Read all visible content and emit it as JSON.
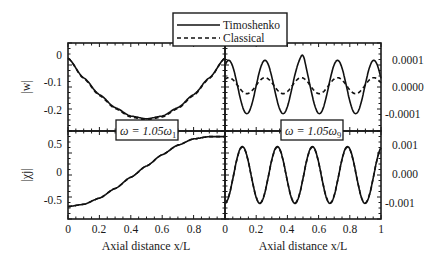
{
  "legend": {
    "entries": [
      {
        "label": "Timoshenko",
        "style": "solid"
      },
      {
        "label": "Classical",
        "style": "dashed"
      }
    ]
  },
  "labels": {
    "freq_left": "ω = 1.05ω",
    "freq_left_sub": "1",
    "freq_right": "ω = 1.05ω",
    "freq_right_sub": "9",
    "ylabel_top": "|w|",
    "ylabel_bottom": "|χj|",
    "xlabel_left": "Axial distance x/L",
    "xlabel_right": "Axial distance x/L"
  },
  "colors": {
    "line": "#111111",
    "background": "#ffffff"
  },
  "chart_data": [
    {
      "type": "line",
      "panel": "top-left",
      "title": "ω = 1.05ω1",
      "xlabel": "",
      "ylabel": "|w|",
      "xlim": [
        0,
        1
      ],
      "ylim": [
        -0.245,
        0.045
      ],
      "yticks": [
        "0",
        "-0.1",
        "-0.2"
      ],
      "x": [
        0,
        0.1,
        0.2,
        0.3,
        0.4,
        0.5,
        0.6,
        0.7,
        0.8,
        0.9,
        1.0
      ],
      "series": [
        {
          "name": "Timoshenko",
          "values": [
            -0.005,
            -0.07,
            -0.125,
            -0.168,
            -0.196,
            -0.205,
            -0.196,
            -0.168,
            -0.125,
            -0.07,
            -0.005
          ]
        },
        {
          "name": "Classical",
          "values": [
            -0.005,
            -0.072,
            -0.128,
            -0.171,
            -0.199,
            -0.208,
            -0.199,
            -0.171,
            -0.128,
            -0.072,
            -0.005
          ]
        }
      ]
    },
    {
      "type": "line",
      "panel": "bottom-left",
      "xlabel": "Axial distance x/L",
      "ylabel": "|χj|",
      "xlim": [
        0,
        1
      ],
      "ylim": [
        -0.84,
        0.72
      ],
      "xticks": [
        "0",
        "0.2",
        "0.4",
        "0.6",
        "0.8"
      ],
      "yticks": [
        "0.5",
        "0",
        "-0.5"
      ],
      "x": [
        0,
        0.1,
        0.2,
        0.3,
        0.4,
        0.5,
        0.6,
        0.7,
        0.8,
        0.9,
        1.0
      ],
      "series": [
        {
          "name": "Timoshenko",
          "values": [
            -0.62,
            -0.58,
            -0.47,
            -0.3,
            -0.1,
            0.1,
            0.3,
            0.47,
            0.58,
            0.62,
            0.62
          ]
        },
        {
          "name": "Classical",
          "values": [
            -0.62,
            -0.58,
            -0.47,
            -0.3,
            -0.1,
            0.1,
            0.3,
            0.47,
            0.58,
            0.62,
            0.62
          ]
        }
      ]
    },
    {
      "type": "line",
      "panel": "top-right",
      "title": "ω = 1.05ω9",
      "xlabel": "",
      "ylabel": "",
      "xlim": [
        0,
        1
      ],
      "ylim": [
        -0.000165,
        0.000165
      ],
      "yticks": [
        "0.0001",
        "0.0000",
        "-0.0001"
      ],
      "y_axis_side": "right",
      "series": [
        {
          "name": "Timoshenko",
          "description": "oscillation with 4 peaks of ~+0.0001 at x≈0.14,0.37,0.63,0.86; troughs ~-0.0001; double-dip at x=0.5",
          "amplitude": 0.0001,
          "peaks_x": [
            0.14,
            0.37,
            0.63,
            0.86
          ]
        },
        {
          "name": "Classical",
          "description": "smaller oscillation, peaks ~+0.00004, troughs ~-0.00002",
          "amplitude": 3e-05,
          "peaks_x": [
            0.14,
            0.37,
            0.63,
            0.86
          ]
        }
      ]
    },
    {
      "type": "line",
      "panel": "bottom-right",
      "xlabel": "Axial distance x/L",
      "ylabel": "",
      "xlim": [
        0,
        1
      ],
      "ylim": [
        -0.00155,
        0.00155
      ],
      "xticks": [
        "0",
        "0.2",
        "0.4",
        "0.6",
        "0.8",
        "1"
      ],
      "yticks": [
        "0.001",
        "0.000",
        "-0.001"
      ],
      "y_axis_side": "right",
      "series": [
        {
          "name": "Timoshenko",
          "description": "oscillation amplitude ~0.001, peaks at x≈0.11,0.33,0.57,0.79,1.0; troughs x≈0.22,0.45,0.68,0.9",
          "amplitude": 0.001
        },
        {
          "name": "Classical",
          "description": "nearly coincident with Timoshenko",
          "amplitude": 0.00098
        }
      ]
    }
  ]
}
